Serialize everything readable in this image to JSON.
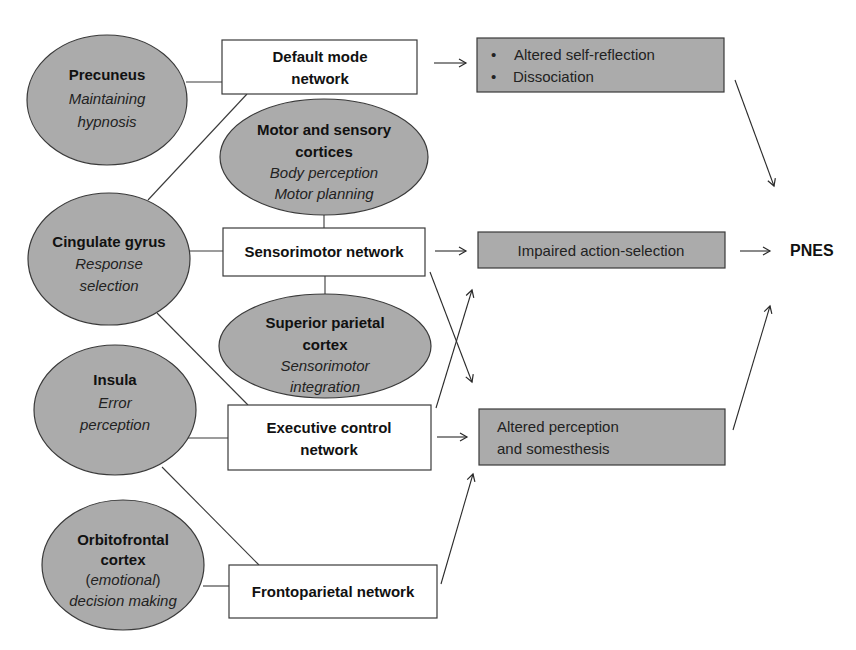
{
  "diagram": {
    "regions": {
      "precuneus": {
        "title": "Precuneus",
        "role_line1": "Maintaining",
        "role_line2": "hypnosis"
      },
      "motor_sensory": {
        "title_line1": "Motor and sensory",
        "title_line2": "cortices",
        "role_line1": "Body perception",
        "role_line2": "Motor planning"
      },
      "cingulate": {
        "title": "Cingulate gyrus",
        "role_line1": "Response",
        "role_line2": "selection"
      },
      "superior_parietal": {
        "title_line1": "Superior parietal",
        "title_line2": "cortex",
        "role_line1": "Sensorimotor",
        "role_line2": "integration"
      },
      "insula": {
        "title": "Insula",
        "role_line1": "Error",
        "role_line2": "perception"
      },
      "orbitofrontal": {
        "title_line1": "Orbitofrontal",
        "title_line2": "cortex",
        "role_paren_open": "(",
        "role_emotional": "emotional",
        "role_paren_close": ")",
        "role_line2": "decision making"
      }
    },
    "networks": {
      "default_mode": {
        "line1": "Default mode",
        "line2": "network"
      },
      "sensorimotor": {
        "label": "Sensorimotor network"
      },
      "executive": {
        "line1": "Executive control",
        "line2": "network"
      },
      "frontoparietal": {
        "label": "Frontoparietal network"
      }
    },
    "outcomes": {
      "self_reflection": {
        "bullet": "•",
        "item1": "Altered self-reflection",
        "item2": "Dissociation"
      },
      "action_selection": {
        "label": "Impaired action-selection"
      },
      "perception": {
        "line1": "Altered perception",
        "line2": "and somesthesis"
      }
    },
    "final": {
      "label": "PNES"
    },
    "colors": {
      "region_fill": "#ababab",
      "outcome_fill": "#ababab",
      "network_fill": "#ffffff",
      "stroke": "#3a3a3a"
    }
  }
}
